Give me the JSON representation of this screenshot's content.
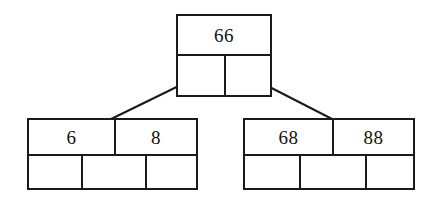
{
  "diagram": {
    "type": "b-tree",
    "background_color": "#ffffff",
    "line_color": "#1a1a1a",
    "text_color": "#111111",
    "nodes": [
      {
        "id": "root",
        "role": "root",
        "keys": [
          "66"
        ],
        "key_count": 1,
        "pointer_count": 2,
        "pointers": [
          "",
          ""
        ]
      },
      {
        "id": "left-child",
        "role": "leaf",
        "keys": [
          "6",
          "8"
        ],
        "key_count": 2,
        "pointer_count": 3,
        "pointers": [
          "",
          "",
          ""
        ]
      },
      {
        "id": "right-child",
        "role": "leaf",
        "keys": [
          "68",
          "88"
        ],
        "key_count": 2,
        "pointer_count": 3,
        "pointers": [
          "",
          "",
          ""
        ]
      }
    ],
    "edges": [
      {
        "id": "edge-root-left",
        "from": "root",
        "from_pointer": 0,
        "to": "left-child"
      },
      {
        "id": "edge-root-right",
        "from": "root",
        "from_pointer": 1,
        "to": "right-child"
      }
    ]
  }
}
